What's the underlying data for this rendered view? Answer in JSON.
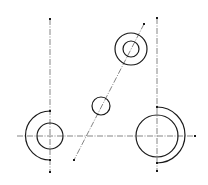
{
  "diagram": {
    "type": "technical-drawing",
    "colors": {
      "line": "#1a1a1a",
      "centerline": "#333333",
      "background": "#ffffff"
    },
    "centerlines": [
      {
        "id": "left-vertical",
        "x1": 50,
        "y1": 19,
        "x2": 50,
        "y2": 172
      },
      {
        "id": "right-vertical",
        "x1": 157,
        "y1": 18,
        "x2": 157,
        "y2": 171
      },
      {
        "id": "horizontal",
        "x1": 17,
        "y1": 136,
        "x2": 195,
        "y2": 136
      },
      {
        "id": "diagonal",
        "x1": 144,
        "y1": 24,
        "x2": 74,
        "y2": 160
      }
    ],
    "circles": [
      {
        "id": "left-circle",
        "cx": 50,
        "cy": 136,
        "r": 13
      },
      {
        "id": "right-circle",
        "cx": 157,
        "cy": 136,
        "r": 21
      },
      {
        "id": "top-outer-circle",
        "cx": 131,
        "cy": 49,
        "r": 16
      },
      {
        "id": "top-inner-circle",
        "cx": 131,
        "cy": 49,
        "r": 8
      },
      {
        "id": "middle-small-circle",
        "cx": 101,
        "cy": 106,
        "r": 9
      }
    ],
    "arcs": [
      {
        "id": "left-arc",
        "cx": 50,
        "cy": 136,
        "r": 24,
        "side": "left"
      },
      {
        "id": "right-arc",
        "cx": 157,
        "cy": 136,
        "r": 28,
        "side": "right"
      }
    ],
    "points": [
      {
        "id": "left-top",
        "x": 50,
        "y": 19
      },
      {
        "id": "left-arc-start",
        "x": 50,
        "y": 111
      },
      {
        "id": "left-arc-end",
        "x": 50,
        "y": 160
      },
      {
        "id": "left-bottom",
        "x": 50,
        "y": 172
      },
      {
        "id": "right-top",
        "x": 157,
        "y": 18
      },
      {
        "id": "right-arc-start",
        "x": 157,
        "y": 107
      },
      {
        "id": "right-arc-end",
        "x": 157,
        "y": 163
      },
      {
        "id": "right-bottom",
        "x": 157,
        "y": 171
      },
      {
        "id": "horizontal-right",
        "x": 195,
        "y": 136
      },
      {
        "id": "diagonal-top",
        "x": 144,
        "y": 24
      },
      {
        "id": "diagonal-bottom",
        "x": 74,
        "y": 160
      }
    ]
  }
}
